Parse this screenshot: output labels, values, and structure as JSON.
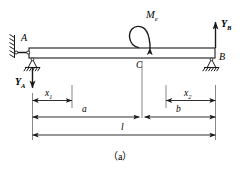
{
  "figure": {
    "caption": "（a）",
    "stroke_color": "#1a1a1a",
    "fill_color": "#ffffff",
    "background_color": "#ffffff"
  },
  "beam": {
    "label_A": "A",
    "label_B": "B",
    "label_C": "C"
  },
  "loads": {
    "moment": {
      "symbol": "M",
      "subscript": "e",
      "sense": "clockwise"
    },
    "reaction_left": {
      "symbol": "Y",
      "subscript": "A",
      "direction": "down"
    },
    "reaction_right": {
      "symbol": "Y",
      "subscript": "B",
      "direction": "up"
    }
  },
  "dimensions": [
    {
      "name": "x1",
      "symbol": "x",
      "subscript": "1"
    },
    {
      "name": "x2",
      "symbol": "x",
      "subscript": "2"
    },
    {
      "name": "a",
      "symbol": "a",
      "subscript": ""
    },
    {
      "name": "b",
      "symbol": "b",
      "subscript": ""
    },
    {
      "name": "l",
      "symbol": "l",
      "subscript": ""
    }
  ]
}
